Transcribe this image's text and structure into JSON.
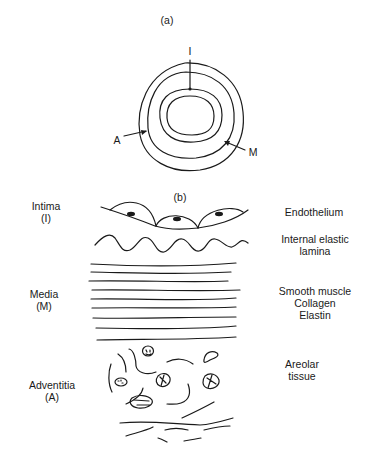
{
  "panel_a": {
    "label": "(a)",
    "pointers": {
      "intima": "I",
      "adventitia": "A",
      "media": "M"
    }
  },
  "panel_b": {
    "label": "(b)",
    "layers": [
      {
        "name": "Intima",
        "abbr": "(I)",
        "components": [
          "Endothelium",
          "Internal elastic lamina"
        ]
      },
      {
        "name": "Media",
        "abbr": "(M)",
        "components": [
          "Smooth muscle",
          "Collagen",
          "Elastin"
        ]
      },
      {
        "name": "Adventitia",
        "abbr": "(A)",
        "components": [
          "Areolar tissue"
        ]
      }
    ],
    "right_labels": {
      "endothelium": "Endothelium",
      "iel_line1": "Internal elastic",
      "iel_line2": "lamina",
      "media_1": "Smooth muscle",
      "media_2": "Collagen",
      "media_3": "Elastin",
      "adv_1": "Areolar",
      "adv_2": "tissue"
    }
  },
  "colors": {
    "ink": "#1a1a1a",
    "background": "#ffffff"
  }
}
